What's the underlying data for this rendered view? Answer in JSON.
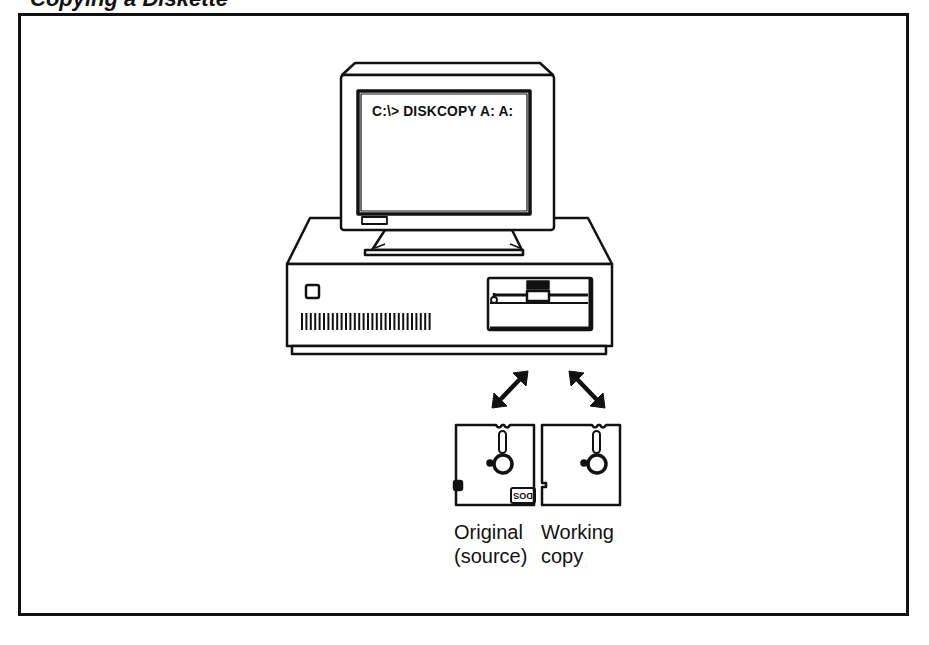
{
  "figure": {
    "title_partial": "Copying a Diskette",
    "screen_command": "C:\\> DISKCOPY  A:  A:",
    "disks": [
      {
        "caption_line1": "Original",
        "caption_line2": "(source)",
        "label": "DOS",
        "write_protect_tab": true
      },
      {
        "caption_line1": "Working",
        "caption_line2": "copy",
        "label": "",
        "write_protect_tab": false
      }
    ],
    "arrows": [
      "bidirectional-arrow-original",
      "bidirectional-arrow-working-copy"
    ],
    "icons": {
      "computer": "computer-icon",
      "monitor": "monitor-icon",
      "floppy_drive": "floppy-drive-icon",
      "floppy_disk": "floppy-disk-icon"
    }
  }
}
